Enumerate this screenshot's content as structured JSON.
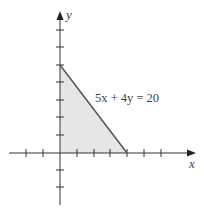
{
  "diagram": {
    "equation_label": "5x + 4y = 20",
    "x_axis_label": "x",
    "y_axis_label": "y",
    "region_fill": "#e6e6e6",
    "line_color": "#555555",
    "axis_color": "#333333",
    "intercepts": {
      "x": 4,
      "y": 5
    },
    "x_ticks": [
      -3,
      -2,
      -1,
      1,
      2,
      3,
      4,
      5,
      6
    ],
    "y_ticks": [
      -3,
      -2,
      -1,
      1,
      2,
      3,
      4,
      5,
      6,
      7
    ]
  }
}
